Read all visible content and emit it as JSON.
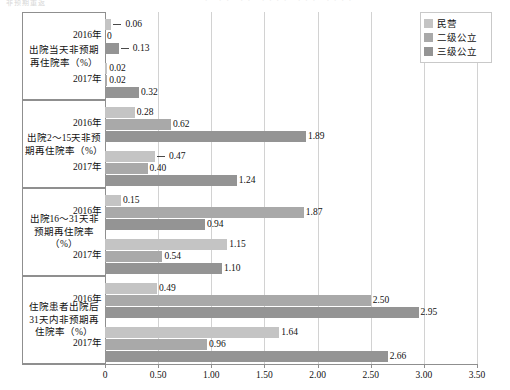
{
  "top_strip": {
    "ghost_left": "非预期重返",
    "ghost_right": "· ·· ·· ···· ··· ····"
  },
  "legend": {
    "items": [
      {
        "label": "民营",
        "color": "#c4c4c4",
        "key": "private"
      },
      {
        "label": "二级公立",
        "color": "#a9a9a9",
        "key": "secondary-public"
      },
      {
        "label": "三级公立",
        "color": "#949494",
        "key": "tertiary-public"
      }
    ]
  },
  "axis": {
    "x_ticks": [
      "0",
      "0.50",
      "1.00",
      "1.50",
      "2.00",
      "2.50",
      "3.00",
      "3.50"
    ],
    "x_min": 0,
    "x_max": 3.5
  },
  "years": [
    "2016年",
    "2017年"
  ],
  "categories": [
    "出院当天非预期再住院率（%）",
    "出院2～15天非预期再住院率（%）",
    "出院16～31天非预期再住院率（%）",
    "住院患者出院后31天内非预期再住院率（%）"
  ],
  "chart_data": {
    "type": "bar",
    "orientation": "horizontal",
    "title": "",
    "xlabel": "",
    "ylabel": "",
    "xlim": [
      0,
      3.5
    ],
    "grid": true,
    "legend_position": "top-right",
    "categories": [
      "出院当天非预期再住院率（%）",
      "出院2～15天非预期再住院率（%）",
      "出院16～31天非预期再住院率（%）",
      "住院患者出院后31天内非预期再住院率（%）"
    ],
    "subgroups": [
      "2016年",
      "2017年"
    ],
    "series": [
      {
        "name": "民营",
        "color": "#c4c4c4",
        "values": {
          "出院当天非预期再住院率（%）": {
            "2016年": 0.06,
            "2017年": 0.02
          },
          "出院2～15天非预期再住院率（%）": {
            "2016年": 0.28,
            "2017年": 0.47
          },
          "出院16～31天非预期再住院率（%）": {
            "2016年": 0.15,
            "2017年": 1.15
          },
          "住院患者出院后31天内非预期再住院率（%）": {
            "2016年": 0.49,
            "2017年": 1.64
          }
        }
      },
      {
        "name": "二级公立",
        "color": "#a9a9a9",
        "values": {
          "出院当天非预期再住院率（%）": {
            "2016年": 0,
            "2017年": 0.02
          },
          "出院2～15天非预期再住院率（%）": {
            "2016年": 0.62,
            "2017年": 0.4
          },
          "出院16～31天非预期再住院率（%）": {
            "2016年": 1.87,
            "2017年": 0.54
          },
          "住院患者出院后31天内非预期再住院率（%）": {
            "2016年": 2.5,
            "2017年": 0.96
          }
        }
      },
      {
        "name": "三级公立",
        "color": "#949494",
        "values": {
          "出院当天非预期再住院率（%）": {
            "2016年": 0.13,
            "2017年": 0.32
          },
          "出院2～15天非预期再住院率（%）": {
            "2016年": 1.89,
            "2017年": 1.24
          },
          "出院16～31天非预期再住院率（%）": {
            "2016年": 0.94,
            "2017年": 1.1
          },
          "住院患者出院后31天内非预期再住院率（%）": {
            "2016年": 2.95,
            "2017年": 2.66
          }
        }
      }
    ],
    "bars": [
      {
        "group": 0,
        "year": "2016年",
        "series": "民营",
        "value": 0.06,
        "label": "0.06",
        "leader": true
      },
      {
        "group": 0,
        "year": "2016年",
        "series": "二级公立",
        "value": 0,
        "label": "0",
        "leader": false
      },
      {
        "group": 0,
        "year": "2016年",
        "series": "三级公立",
        "value": 0.13,
        "label": "0.13",
        "leader": true
      },
      {
        "group": 0,
        "year": "2017年",
        "series": "民营",
        "value": 0.02,
        "label": "0.02",
        "leader": false
      },
      {
        "group": 0,
        "year": "2017年",
        "series": "二级公立",
        "value": 0.02,
        "label": "0.02",
        "leader": false
      },
      {
        "group": 0,
        "year": "2017年",
        "series": "三级公立",
        "value": 0.32,
        "label": "0.32",
        "leader": false
      },
      {
        "group": 1,
        "year": "2016年",
        "series": "民营",
        "value": 0.28,
        "label": "0.28",
        "leader": false
      },
      {
        "group": 1,
        "year": "2016年",
        "series": "二级公立",
        "value": 0.62,
        "label": "0.62",
        "leader": false
      },
      {
        "group": 1,
        "year": "2016年",
        "series": "三级公立",
        "value": 1.89,
        "label": "1.89",
        "leader": false
      },
      {
        "group": 1,
        "year": "2017年",
        "series": "民营",
        "value": 0.47,
        "label": "0.47",
        "leader": true
      },
      {
        "group": 1,
        "year": "2017年",
        "series": "二级公立",
        "value": 0.4,
        "label": "0.40",
        "leader": false
      },
      {
        "group": 1,
        "year": "2017年",
        "series": "三级公立",
        "value": 1.24,
        "label": "1.24",
        "leader": false
      },
      {
        "group": 2,
        "year": "2016年",
        "series": "民营",
        "value": 0.15,
        "label": "0.15",
        "leader": false
      },
      {
        "group": 2,
        "year": "2016年",
        "series": "二级公立",
        "value": 1.87,
        "label": "1.87",
        "leader": false
      },
      {
        "group": 2,
        "year": "2016年",
        "series": "三级公立",
        "value": 0.94,
        "label": "0.94",
        "leader": false
      },
      {
        "group": 2,
        "year": "2017年",
        "series": "民营",
        "value": 1.15,
        "label": "1.15",
        "leader": false
      },
      {
        "group": 2,
        "year": "2017年",
        "series": "二级公立",
        "value": 0.54,
        "label": "0.54",
        "leader": false
      },
      {
        "group": 2,
        "year": "2017年",
        "series": "三级公立",
        "value": 1.1,
        "label": "1.10",
        "leader": false
      },
      {
        "group": 3,
        "year": "2016年",
        "series": "民营",
        "value": 0.49,
        "label": "0.49",
        "leader": false
      },
      {
        "group": 3,
        "year": "2016年",
        "series": "二级公立",
        "value": 2.5,
        "label": "2.50",
        "leader": false
      },
      {
        "group": 3,
        "year": "2016年",
        "series": "三级公立",
        "value": 2.95,
        "label": "2.95",
        "leader": false
      },
      {
        "group": 3,
        "year": "2017年",
        "series": "民营",
        "value": 1.64,
        "label": "1.64",
        "leader": false
      },
      {
        "group": 3,
        "year": "2017年",
        "series": "二级公立",
        "value": 0.96,
        "label": "0.96",
        "leader": false
      },
      {
        "group": 3,
        "year": "2017年",
        "series": "三级公立",
        "value": 2.66,
        "label": "2.66",
        "leader": false
      }
    ]
  }
}
